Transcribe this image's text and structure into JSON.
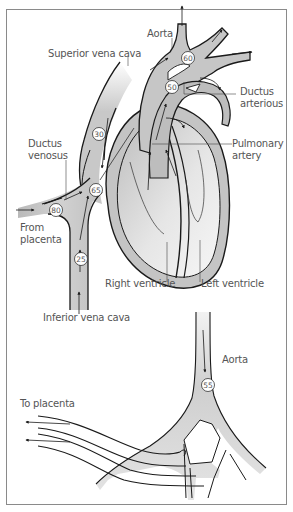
{
  "diagram": {
    "colors": {
      "vessel_fill": "#c8c8c8",
      "vessel_fill_light": "#ececec",
      "outline": "#1a1a1a",
      "label_text": "#555555",
      "frame_border": "#8a8a8a",
      "background": "#ffffff"
    },
    "labels": {
      "aorta_top": "Aorta",
      "superior_vena_cava": "Superior vena cava",
      "ductus_arterious": "Ductus\narterious",
      "ductus_venosus": "Ductus\nvenosus",
      "pulmonary_artery": "Pulmonary\nartery",
      "from_placenta": "From\nplacenta",
      "right_ventricle": "Right ventricle",
      "left_ventricle": "Left ventricle",
      "inferior_vena_cava": "Inferior vena cava",
      "aorta_bottom": "Aorta",
      "to_placenta": "To placenta"
    },
    "oxygen_saturation_badges": [
      {
        "id": "aorta-arch",
        "value": "60"
      },
      {
        "id": "ductus-arterious",
        "value": "50"
      },
      {
        "id": "superior-vena-cava",
        "value": "30"
      },
      {
        "id": "right-atrium",
        "value": "65"
      },
      {
        "id": "umbilical-vein",
        "value": "80"
      },
      {
        "id": "inferior-vena-cava",
        "value": "25"
      },
      {
        "id": "descending-aorta",
        "value": "55"
      }
    ]
  }
}
